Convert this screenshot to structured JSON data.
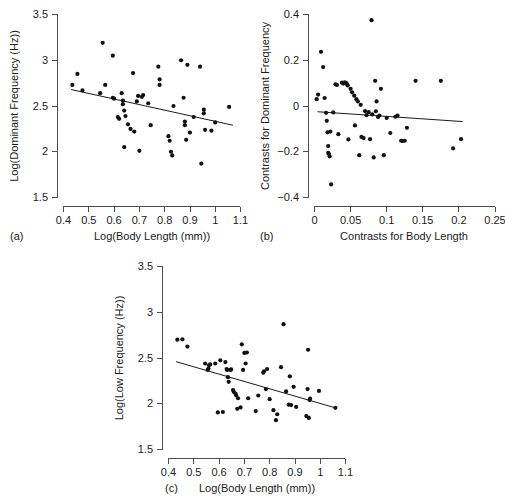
{
  "figure": {
    "background": "#ffffff",
    "point_color": "#111111",
    "axis_color": "#4d4d4d",
    "line_color": "#1a1a1a"
  },
  "chart_data": [
    {
      "type": "scatter",
      "panel_label": "(a)",
      "title": "",
      "xlabel": "Log(Body Length (mm))",
      "ylabel": "Log(Dominant Frequency (Hz))",
      "xlim": [
        0.4,
        1.1
      ],
      "ylim": [
        1.5,
        3.5
      ],
      "xticks": [
        0.4,
        0.5,
        0.6,
        0.7,
        0.8,
        0.9,
        1,
        1.1
      ],
      "xtick_labels": [
        "0.4",
        "0.5",
        "0.6",
        "0.7",
        "0.8",
        "0.9",
        "1",
        "1.1"
      ],
      "yticks": [
        1.5,
        2,
        2.5,
        3,
        3.5
      ],
      "ytick_labels": [
        "1.5",
        "2",
        "2.5",
        "3",
        "3.5"
      ],
      "grid": false,
      "legend": "none",
      "trendline": {
        "x0": 0.43,
        "y0": 2.68,
        "x1": 1.07,
        "y1": 2.29
      },
      "points": [
        [
          0.435,
          2.73
        ],
        [
          0.455,
          2.85
        ],
        [
          0.475,
          2.67
        ],
        [
          0.545,
          2.64
        ],
        [
          0.555,
          3.19
        ],
        [
          0.565,
          2.73
        ],
        [
          0.595,
          3.05
        ],
        [
          0.595,
          2.59
        ],
        [
          0.6,
          2.58
        ],
        [
          0.615,
          2.38
        ],
        [
          0.62,
          2.36
        ],
        [
          0.63,
          2.64
        ],
        [
          0.635,
          2.56
        ],
        [
          0.635,
          2.52
        ],
        [
          0.64,
          2.45
        ],
        [
          0.64,
          2.05
        ],
        [
          0.645,
          2.39
        ],
        [
          0.655,
          2.3
        ],
        [
          0.665,
          2.25
        ],
        [
          0.675,
          2.86
        ],
        [
          0.68,
          2.22
        ],
        [
          0.69,
          2.55
        ],
        [
          0.695,
          2.61
        ],
        [
          0.7,
          2.01
        ],
        [
          0.71,
          2.6
        ],
        [
          0.715,
          2.62
        ],
        [
          0.735,
          2.53
        ],
        [
          0.745,
          2.29
        ],
        [
          0.775,
          2.93
        ],
        [
          0.78,
          2.79
        ],
        [
          0.78,
          2.73
        ],
        [
          0.815,
          2.17
        ],
        [
          0.82,
          2.12
        ],
        [
          0.825,
          2.0
        ],
        [
          0.83,
          1.96
        ],
        [
          0.835,
          2.5
        ],
        [
          0.865,
          3.0
        ],
        [
          0.875,
          2.59
        ],
        [
          0.88,
          2.33
        ],
        [
          0.88,
          2.29
        ],
        [
          0.885,
          2.13
        ],
        [
          0.89,
          2.95
        ],
        [
          0.9,
          2.21
        ],
        [
          0.915,
          2.38
        ],
        [
          0.94,
          2.93
        ],
        [
          0.945,
          1.87
        ],
        [
          0.955,
          2.46
        ],
        [
          0.955,
          2.42
        ],
        [
          0.96,
          2.24
        ],
        [
          0.985,
          2.23
        ],
        [
          1.0,
          2.32
        ],
        [
          1.055,
          2.49
        ]
      ]
    },
    {
      "type": "scatter",
      "panel_label": "(b)",
      "title": "",
      "xlabel": "Contrasts for Body Length",
      "ylabel": "Contrasts for Dominant Frequency",
      "xlim": [
        0,
        0.25
      ],
      "ylim": [
        -0.4,
        0.4
      ],
      "xticks": [
        0,
        0.05,
        0.1,
        0.15,
        0.2,
        0.25
      ],
      "xtick_labels": [
        "0",
        "0.05",
        "0.1",
        "0.15",
        "0.2",
        "0.25"
      ],
      "yticks": [
        -0.4,
        -0.2,
        0,
        0.2,
        0.4
      ],
      "ytick_labels": [
        "−0.4",
        "−0.2",
        "0",
        "0.2",
        "0.4"
      ],
      "grid": false,
      "legend": "none",
      "trendline": {
        "x0": 0.004,
        "y0": -0.025,
        "x1": 0.205,
        "y1": -0.068
      },
      "points": [
        [
          0.003,
          0.03
        ],
        [
          0.005,
          0.05
        ],
        [
          0.009,
          0.237
        ],
        [
          0.012,
          0.17
        ],
        [
          0.014,
          0.035
        ],
        [
          0.016,
          -0.03
        ],
        [
          0.017,
          -0.065
        ],
        [
          0.018,
          -0.115
        ],
        [
          0.019,
          -0.175
        ],
        [
          0.019,
          -0.205
        ],
        [
          0.02,
          -0.21
        ],
        [
          0.021,
          -0.22
        ],
        [
          0.022,
          -0.112
        ],
        [
          0.023,
          -0.343
        ],
        [
          0.026,
          -0.028
        ],
        [
          0.029,
          0.095
        ],
        [
          0.031,
          0.092
        ],
        [
          0.033,
          -0.123
        ],
        [
          0.038,
          0.102
        ],
        [
          0.04,
          0.098
        ],
        [
          0.042,
          0.103
        ],
        [
          0.044,
          0.1
        ],
        [
          0.045,
          0.095
        ],
        [
          0.046,
          0.09
        ],
        [
          0.047,
          -0.146
        ],
        [
          0.05,
          0.075
        ],
        [
          0.052,
          0.06
        ],
        [
          0.055,
          0.045
        ],
        [
          0.056,
          -0.085
        ],
        [
          0.058,
          0.03
        ],
        [
          0.06,
          0.02
        ],
        [
          0.062,
          -0.215
        ],
        [
          0.064,
          0.005
        ],
        [
          0.065,
          -0.135
        ],
        [
          0.068,
          -0.14
        ],
        [
          0.07,
          -0.022
        ],
        [
          0.072,
          -0.04
        ],
        [
          0.075,
          -0.027
        ],
        [
          0.077,
          -0.145
        ],
        [
          0.079,
          0.375
        ],
        [
          0.08,
          -0.037
        ],
        [
          0.082,
          -0.225
        ],
        [
          0.084,
          0.11
        ],
        [
          0.085,
          -0.023
        ],
        [
          0.086,
          0.02
        ],
        [
          0.088,
          -0.048
        ],
        [
          0.09,
          -0.042
        ],
        [
          0.092,
          0.075
        ],
        [
          0.096,
          -0.215
        ],
        [
          0.1,
          -0.052
        ],
        [
          0.105,
          -0.118
        ],
        [
          0.112,
          -0.047
        ],
        [
          0.115,
          -0.042
        ],
        [
          0.12,
          -0.152
        ],
        [
          0.122,
          -0.153
        ],
        [
          0.125,
          -0.152
        ],
        [
          0.128,
          -0.095
        ],
        [
          0.14,
          0.11
        ],
        [
          0.175,
          0.11
        ],
        [
          0.192,
          -0.185
        ],
        [
          0.203,
          -0.145
        ]
      ]
    },
    {
      "type": "scatter",
      "panel_label": "(c)",
      "title": "",
      "xlabel": "Log(Body Length (mm))",
      "ylabel": "Log(Low Frequency (Hz))",
      "xlim": [
        0.4,
        1.1
      ],
      "ylim": [
        1.5,
        3.5
      ],
      "xticks": [
        0.4,
        0.5,
        0.6,
        0.7,
        0.8,
        0.9,
        1,
        1.1
      ],
      "xtick_labels": [
        "0.4",
        "0.5",
        "0.6",
        "0.7",
        "0.8",
        "0.9",
        "1",
        "1.1"
      ],
      "yticks": [
        1.5,
        2,
        2.5,
        3,
        3.5
      ],
      "ytick_labels": [
        "1.5",
        "2",
        "2.5",
        "3",
        "3.5"
      ],
      "grid": false,
      "legend": "none",
      "trendline": {
        "x0": 0.43,
        "y0": 2.46,
        "x1": 1.06,
        "y1": 1.955
      },
      "points": [
        [
          0.435,
          2.7
        ],
        [
          0.455,
          2.705
        ],
        [
          0.475,
          2.625
        ],
        [
          0.545,
          2.44
        ],
        [
          0.555,
          2.37
        ],
        [
          0.558,
          2.385
        ],
        [
          0.56,
          2.42
        ],
        [
          0.565,
          2.43
        ],
        [
          0.585,
          2.44
        ],
        [
          0.595,
          1.905
        ],
        [
          0.605,
          2.475
        ],
        [
          0.615,
          1.91
        ],
        [
          0.625,
          2.455
        ],
        [
          0.63,
          2.38
        ],
        [
          0.632,
          2.37
        ],
        [
          0.635,
          2.29
        ],
        [
          0.638,
          2.24
        ],
        [
          0.645,
          2.37
        ],
        [
          0.648,
          2.375
        ],
        [
          0.655,
          2.15
        ],
        [
          0.658,
          2.13
        ],
        [
          0.665,
          2.11
        ],
        [
          0.668,
          2.09
        ],
        [
          0.672,
          1.945
        ],
        [
          0.675,
          2.06
        ],
        [
          0.685,
          1.96
        ],
        [
          0.69,
          2.65
        ],
        [
          0.695,
          2.37
        ],
        [
          0.7,
          2.555
        ],
        [
          0.705,
          2.44
        ],
        [
          0.71,
          2.56
        ],
        [
          0.715,
          2.06
        ],
        [
          0.745,
          1.92
        ],
        [
          0.755,
          2.09
        ],
        [
          0.775,
          2.34
        ],
        [
          0.778,
          2.355
        ],
        [
          0.785,
          2.16
        ],
        [
          0.79,
          2.38
        ],
        [
          0.8,
          2.05
        ],
        [
          0.815,
          1.93
        ],
        [
          0.825,
          1.82
        ],
        [
          0.83,
          1.885
        ],
        [
          0.845,
          2.4
        ],
        [
          0.855,
          2.87
        ],
        [
          0.865,
          2.135
        ],
        [
          0.875,
          1.99
        ],
        [
          0.88,
          2.3
        ],
        [
          0.885,
          1.985
        ],
        [
          0.895,
          2.185
        ],
        [
          0.905,
          1.965
        ],
        [
          0.945,
          1.865
        ],
        [
          0.95,
          2.16
        ],
        [
          0.952,
          2.59
        ],
        [
          0.955,
          1.845
        ],
        [
          0.958,
          2.04
        ],
        [
          0.96,
          2.055
        ],
        [
          0.995,
          2.14
        ],
        [
          1.06,
          1.955
        ]
      ]
    }
  ]
}
